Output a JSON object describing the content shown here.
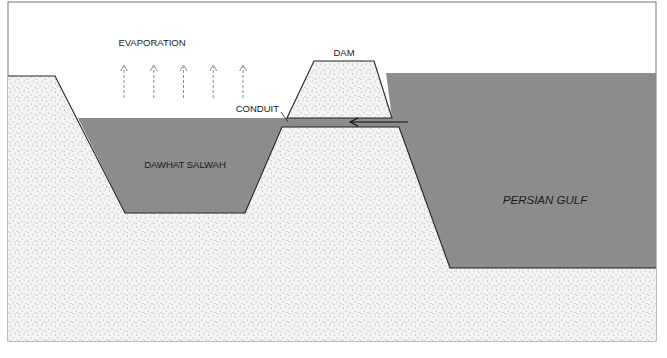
{
  "diagram": {
    "labels": {
      "evaporation": "EVAPORATION",
      "dam": "DAM",
      "conduit": "CONDUIT",
      "basin": "DAWHAT SALWAH",
      "sea": "PERSIAN GULF"
    },
    "evaporation_arrow_count": 5,
    "flow_direction": "from Persian Gulf to Dawhat Salwah through conduit",
    "colors": {
      "water": "#8c8c8c",
      "land": "#f4f4f4",
      "land_dots": "#555555",
      "outline": "#222222",
      "background": "#ffffff"
    }
  }
}
